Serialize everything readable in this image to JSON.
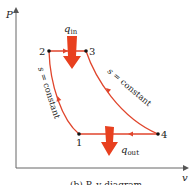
{
  "diagram": {
    "type": "P-v diagram (thermodynamic cycle)",
    "axes": {
      "y_label": "P",
      "x_label": "v"
    },
    "states": [
      {
        "id": "1",
        "label": "1"
      },
      {
        "id": "2",
        "label": "2"
      },
      {
        "id": "3",
        "label": "3"
      },
      {
        "id": "4",
        "label": "4"
      }
    ],
    "processes": [
      {
        "from": "1",
        "to": "2",
        "label": "s = constant"
      },
      {
        "from": "2",
        "to": "3",
        "label": ""
      },
      {
        "from": "3",
        "to": "4",
        "label": "s = constant"
      },
      {
        "from": "4",
        "to": "1",
        "label": ""
      }
    ],
    "heat_in": {
      "symbol": "q",
      "sub": "in"
    },
    "heat_out": {
      "symbol": "q",
      "sub": "out"
    },
    "caption": "(b) P–v diagram",
    "colors": {
      "process_line": "#e0452c",
      "heat_arrow": "#e8401f",
      "axis": "#555555",
      "point": "#111111"
    }
  }
}
